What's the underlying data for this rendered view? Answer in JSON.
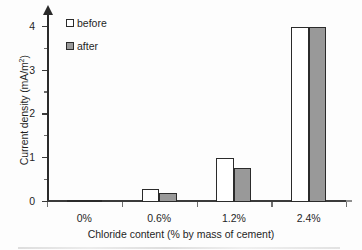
{
  "chart_data": {
    "type": "bar",
    "title": "",
    "xlabel": "Chloride content (% by mass of cement)",
    "ylabel": "Current density (mA/m2)",
    "ylabel_display": "Current density (mA/m",
    "ylabel_sup": "2",
    "ylabel_tail": ")",
    "categories": [
      "0%",
      "0.6%",
      "1.2%",
      "2.4%"
    ],
    "series": [
      {
        "name": "before",
        "values": [
          0.05,
          0.3,
          1.0,
          4.0
        ]
      },
      {
        "name": "after",
        "values": [
          0.03,
          0.2,
          0.78,
          4.0
        ]
      }
    ],
    "ylim": [
      0,
      4.3
    ],
    "yticks": [
      0,
      1,
      2,
      3,
      4
    ],
    "ytick_labels": [
      "0",
      "1",
      "2",
      "3",
      "4"
    ],
    "yminor_ticks": [
      0.5,
      1.5,
      2.5,
      3.5
    ],
    "grid": false,
    "legend_position": "upper left",
    "colors": {
      "before_fill": "#ffffff",
      "after_fill": "#999999",
      "bar_outline": "#2b2b2b",
      "axis": "#2a2a2a",
      "text": "#1f1f1f",
      "background": "#fdfdfd"
    }
  },
  "legend": {
    "items": [
      {
        "label": "before",
        "style": "before"
      },
      {
        "label": "after",
        "style": "after"
      }
    ]
  }
}
